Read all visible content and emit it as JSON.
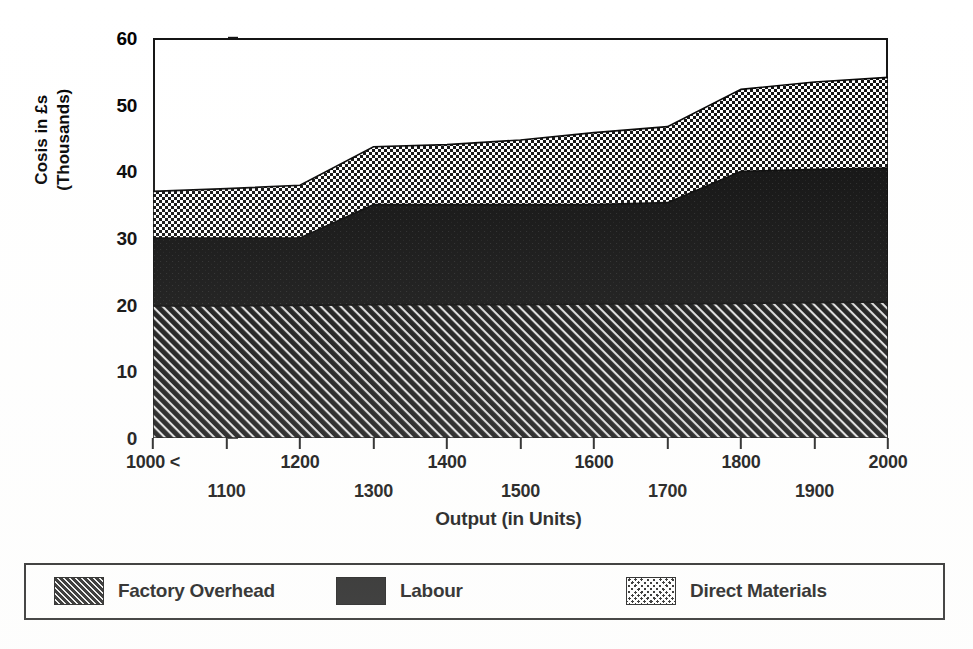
{
  "chart_data": {
    "type": "area",
    "stacked": true,
    "title": "",
    "subtitle": "",
    "xlabel": "Output (in Units)",
    "ylabel": "Cosis in £s (Thousands)",
    "ylabel_lines": [
      "Cosis in £s",
      "(Thousands)"
    ],
    "x": [
      1000,
      1100,
      1200,
      1300,
      1400,
      1500,
      1600,
      1700,
      1800,
      1900,
      2000
    ],
    "xlim": [
      1000,
      2000
    ],
    "ylim": [
      0,
      60
    ],
    "ytick_values": [
      0,
      10,
      20,
      30,
      40,
      50,
      60
    ],
    "ytick_labels": [
      "0",
      "10",
      "20",
      "30",
      "40",
      "50",
      "60"
    ],
    "xtick_values": [
      1000,
      1100,
      1200,
      1300,
      1400,
      1500,
      1600,
      1700,
      1800,
      1900,
      2000
    ],
    "xtick_labels_top": [
      "1000 <",
      "1200",
      "1400",
      "1600",
      "1800",
      "2000"
    ],
    "xtick_labels_top_values": [
      1000,
      1200,
      1400,
      1600,
      1800,
      2000
    ],
    "xtick_labels_bottom": [
      "1100",
      "1300",
      "1500",
      "1700",
      "1900"
    ],
    "xtick_labels_bottom_values": [
      1100,
      1300,
      1500,
      1700,
      1900
    ],
    "first_tick_marker": "<",
    "grid": false,
    "legend_position": "below-plot-boxed",
    "series": [
      {
        "name": "Factory Overhead",
        "pattern": "diagonal-hatch",
        "color": "#0a0a0a",
        "values": [
          19.8,
          19.8,
          19.9,
          20.0,
          20.0,
          20.0,
          20.1,
          20.1,
          20.2,
          20.3,
          20.4
        ]
      },
      {
        "name": "Labour",
        "pattern": "solid",
        "color": "#0a0a0a",
        "values": [
          10.2,
          10.2,
          10.1,
          15.0,
          15.0,
          15.0,
          14.9,
          15.2,
          19.8,
          20.0,
          20.1
        ]
      },
      {
        "name": "Direct Materials",
        "pattern": "checkerboard",
        "color": "#0a0a0a",
        "values": [
          7.0,
          7.4,
          7.9,
          8.7,
          9.0,
          9.7,
          10.8,
          11.4,
          12.3,
          13.1,
          13.6
        ]
      }
    ],
    "cumulative_tops": {
      "factory_overhead": [
        19.8,
        19.8,
        19.9,
        20.0,
        20.0,
        20.0,
        20.1,
        20.1,
        20.2,
        20.3,
        20.4
      ],
      "labour": [
        30.0,
        30.0,
        30.0,
        35.0,
        35.0,
        35.0,
        35.0,
        35.3,
        40.0,
        40.3,
        40.5
      ],
      "direct_materials": [
        37.0,
        37.4,
        37.9,
        43.7,
        44.0,
        44.7,
        45.8,
        46.7,
        52.3,
        53.4,
        54.1
      ]
    }
  },
  "legend": {
    "items": [
      {
        "label": "Factory Overhead",
        "swatch": "diagonal-hatch-swatch"
      },
      {
        "label": "Labour",
        "swatch": "solid-black-swatch"
      },
      {
        "label": "Direct Materials",
        "swatch": "checkerboard-swatch"
      }
    ]
  }
}
